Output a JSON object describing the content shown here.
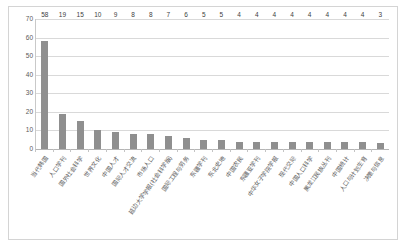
{
  "chart_data": {
    "type": "bar",
    "title": "",
    "subtitle": "",
    "xlabel": "",
    "ylabel": "",
    "ylim": [
      0,
      70
    ],
    "ytick_step": 10,
    "yticks": [
      70,
      60,
      50,
      40,
      30,
      20,
      10,
      0
    ],
    "grid": true,
    "legend": "none",
    "bar_color": "#8f8f8f",
    "categories": [
      "当代韩国",
      "人口学刊",
      "国外社会科学",
      "世界文化",
      "中国人才",
      "国际人才交流",
      "市场人口",
      "延边大学学报(社会科学版)",
      "国际工程与劳务",
      "东疆学刊",
      "东北史地",
      "中国农民",
      "东疆亚学刊",
      "中华女子学院学报",
      "现代交际",
      "中国人口科学",
      "黑龙江民族丛刊",
      "中国统计",
      "人口与计划生育",
      "决策与信息"
    ],
    "values": [
      58,
      19,
      15,
      10,
      9,
      8,
      8,
      7,
      6,
      5,
      5,
      4,
      4,
      4,
      4,
      4,
      4,
      4,
      4,
      3
    ]
  },
  "frame": {
    "border_color": "#d4d4d4",
    "background": "#ffffff"
  }
}
